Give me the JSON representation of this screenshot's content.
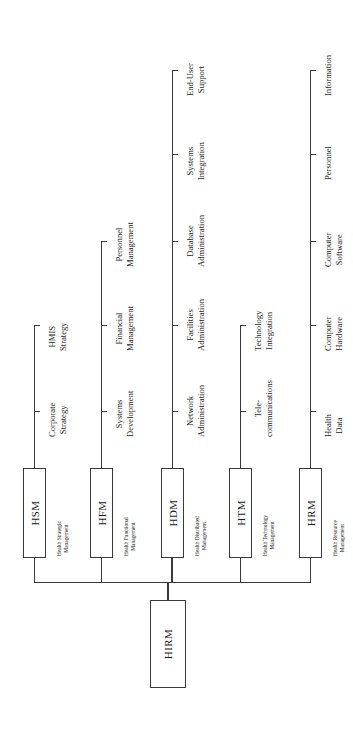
{
  "diagram": {
    "orientation": "rotated-90",
    "line_color": "#3a3a3a",
    "background_color": "#ffffff",
    "root": {
      "code": "HIRM",
      "full_name": ""
    },
    "divisions": [
      {
        "code": "HSM",
        "full_name_line1": "Health Strategic",
        "full_name_line2": "Management",
        "leaves": [
          {
            "line1": "Corporate",
            "line2": "Strategy"
          },
          {
            "line1": "HMIS",
            "line2": "Strategy"
          }
        ]
      },
      {
        "code": "HFM",
        "full_name_line1": "Health Functional",
        "full_name_line2": "Management",
        "leaves": [
          {
            "line1": "Systems",
            "line2": "Development"
          },
          {
            "line1": "Financial",
            "line2": "Management"
          },
          {
            "line1": "Personnel",
            "line2": "Management"
          }
        ]
      },
      {
        "code": "HDM",
        "full_name_line1": "Health Distributed",
        "full_name_line2": "Management",
        "leaves": [
          {
            "line1": "Network",
            "line2": "Administration"
          },
          {
            "line1": "Facilities",
            "line2": "Administration"
          },
          {
            "line1": "Database",
            "line2": "Administration"
          },
          {
            "line1": "Systems",
            "line2": "Integration"
          },
          {
            "line1": "End-User",
            "line2": "Support"
          }
        ]
      },
      {
        "code": "HTM",
        "full_name_line1": "Health Technology",
        "full_name_line2": "Management",
        "leaves": [
          {
            "line1": "Tele-",
            "line2": "communications"
          },
          {
            "line1": "Technology",
            "line2": "Integration"
          }
        ]
      },
      {
        "code": "HRM",
        "full_name_line1": "Health Resource",
        "full_name_line2": "Management",
        "leaves": [
          {
            "line1": "Health",
            "line2": "Data"
          },
          {
            "line1": "Computer",
            "line2": "Hardware"
          },
          {
            "line1": "Computer",
            "line2": "Software"
          },
          {
            "line1": "Personnel",
            "line2": ""
          },
          {
            "line1": "Information",
            "line2": ""
          }
        ]
      }
    ]
  },
  "layout": {
    "spine_x": [
      34,
      101,
      172,
      240,
      310
    ],
    "trunk_y": 582,
    "box_top": 468,
    "box_bottom": 558,
    "box_half_width": 11,
    "leaf_tick_y": [
      411,
      325,
      241,
      154,
      70
    ],
    "root_box": {
      "left": 150,
      "top": 600,
      "width": 36,
      "height": 88
    }
  }
}
